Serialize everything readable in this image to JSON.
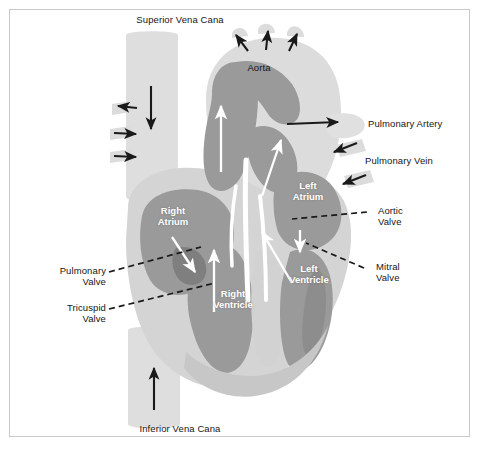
{
  "figure": {
    "border_color": "#c9c9c9",
    "background": "#ffffff"
  },
  "palette": {
    "vessel_light": "#d9d9d9",
    "vessel_light2": "#e2e2e2",
    "chamber_gray": "#9a9a9a",
    "chamber_gray_dark": "#8d8d8d",
    "outline_white": "#ffffff",
    "arrow_black": "#1a1a1a",
    "arrow_white": "#ffffff",
    "label_text": "#161616",
    "inner_text": "#ffffff"
  },
  "labels": {
    "superior_vena_cava": "Superior Vena Cana",
    "aorta": "Aorta",
    "pulmonary_artery": "Pulmonary Artery",
    "pulmonary_vein": "Pulmonary Vein",
    "aortic_valve": "Aortic\nValve",
    "mitral_valve": "Mitral\nValve",
    "pulmonary_valve": "Pulmonary\nValve",
    "tricuspid_valve": "Tricuspid\nValve",
    "inferior_vena_cava": "Inferior Vena Cana"
  },
  "chambers": {
    "right_atrium": "Right\nAtrium",
    "right_ventricle": "Right\nVentricle",
    "left_atrium": "Left\nAtrium",
    "left_ventricle": "Left\nVentricle"
  },
  "flow_arrows": [
    {
      "name": "svc-downward-flow",
      "color": "#1a1a1a",
      "direction": "down"
    },
    {
      "name": "svc-branch-left",
      "color": "#1a1a1a",
      "direction": "left"
    },
    {
      "name": "svc-branch-right-upper",
      "color": "#1a1a1a",
      "direction": "right"
    },
    {
      "name": "svc-branch-right-lower",
      "color": "#1a1a1a",
      "direction": "right"
    },
    {
      "name": "aortic-arch-branch-1",
      "color": "#1a1a1a",
      "direction": "up-left"
    },
    {
      "name": "aortic-arch-branch-2",
      "color": "#1a1a1a",
      "direction": "up"
    },
    {
      "name": "aortic-arch-branch-3",
      "color": "#1a1a1a",
      "direction": "up-right"
    },
    {
      "name": "pulmonary-artery-outflow",
      "color": "#1a1a1a",
      "direction": "right"
    },
    {
      "name": "pulmonary-vein-inflow-upper",
      "color": "#1a1a1a",
      "direction": "down-left"
    },
    {
      "name": "pulmonary-vein-inflow-lower",
      "color": "#1a1a1a",
      "direction": "down-left"
    },
    {
      "name": "ivc-upward-flow",
      "color": "#1a1a1a",
      "direction": "up"
    },
    {
      "name": "aorta-ascending-flow",
      "color": "#ffffff",
      "direction": "up"
    },
    {
      "name": "pulmonary-trunk-flow",
      "color": "#ffffff",
      "direction": "up-right"
    },
    {
      "name": "right-ventricle-outflow",
      "color": "#ffffff",
      "direction": "up"
    },
    {
      "name": "tricuspid-inflow",
      "color": "#ffffff",
      "direction": "down-right"
    },
    {
      "name": "mitral-inflow",
      "color": "#ffffff",
      "direction": "down"
    },
    {
      "name": "left-ventricle-outflow",
      "color": "#ffffff",
      "direction": "up-left"
    }
  ],
  "leader_lines": [
    {
      "name": "aortic-valve-leader",
      "style": "dashed"
    },
    {
      "name": "mitral-valve-leader",
      "style": "dashed"
    },
    {
      "name": "pulmonary-valve-leader",
      "style": "dashed"
    },
    {
      "name": "tricuspid-valve-leader",
      "style": "dashed"
    }
  ]
}
